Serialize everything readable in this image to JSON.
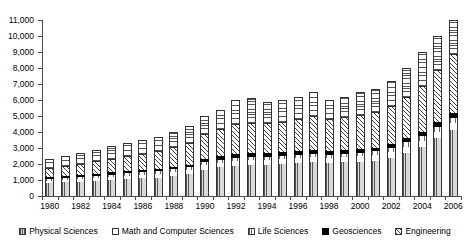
{
  "chart_data": {
    "type": "bar",
    "stacked": true,
    "title": "",
    "xlabel": "",
    "ylabel": "",
    "ylim": [
      0,
      11000
    ],
    "ytick_step": 1000,
    "ytick_labels": [
      "0",
      "1,000",
      "2,000",
      "3,000",
      "4,000",
      "5,000",
      "6,000",
      "7,000",
      "8,000",
      "9,000",
      "10,000",
      "11,000"
    ],
    "grid": false,
    "legend_position": "bottom",
    "categories": [
      "1980",
      "1981",
      "1982",
      "1983",
      "1984",
      "1985",
      "1986",
      "1987",
      "1988",
      "1989",
      "1990",
      "1991",
      "1992",
      "1993",
      "1994",
      "1995",
      "1996",
      "1997",
      "1998",
      "1999",
      "2000",
      "2001",
      "2002",
      "2003",
      "2004",
      "2005",
      "2006"
    ],
    "xtick_labels_shown": [
      "1980",
      "1982",
      "1984",
      "1986",
      "1988",
      "1990",
      "1992",
      "1994",
      "1996",
      "1998",
      "2000",
      "2002",
      "2004",
      "2006"
    ],
    "series": [
      {
        "name": "Physical Sciences",
        "values": [
          800,
          850,
          900,
          950,
          1000,
          1050,
          1100,
          1150,
          1250,
          1350,
          1650,
          1800,
          1900,
          1950,
          1950,
          2000,
          2050,
          2100,
          2050,
          2100,
          2150,
          2200,
          2400,
          2700,
          3050,
          3600,
          4100
        ]
      },
      {
        "name": "Math and Computer Sciences",
        "values": [
          150,
          160,
          170,
          180,
          190,
          200,
          210,
          220,
          240,
          250,
          260,
          270,
          280,
          290,
          290,
          300,
          310,
          320,
          310,
          320,
          330,
          340,
          360,
          380,
          400,
          430,
          460
        ]
      },
      {
        "name": "Life Sciences",
        "values": [
          120,
          125,
          130,
          140,
          150,
          160,
          165,
          170,
          180,
          190,
          200,
          210,
          215,
          220,
          220,
          225,
          230,
          235,
          230,
          235,
          240,
          245,
          255,
          270,
          285,
          300,
          320
        ]
      },
      {
        "name": "Geosciences",
        "values": [
          110,
          120,
          125,
          130,
          140,
          145,
          150,
          160,
          170,
          180,
          200,
          210,
          215,
          220,
          215,
          220,
          225,
          230,
          220,
          225,
          230,
          240,
          250,
          270,
          290,
          310,
          330
        ]
      },
      {
        "name": "Engineering",
        "values": [
          500,
          560,
          620,
          700,
          780,
          860,
          950,
          1050,
          1150,
          1300,
          1500,
          1650,
          1800,
          1850,
          1800,
          1850,
          1950,
          2050,
          1950,
          2000,
          2050,
          2150,
          2300,
          2500,
          2800,
          3200,
          3600
        ]
      },
      {
        "name": "Other",
        "values": [
          620,
          685,
          755,
          800,
          840,
          885,
          925,
          950,
          1010,
          1130,
          1190,
          1260,
          1590,
          1570,
          1425,
          1405,
          1435,
          1565,
          1240,
          1320,
          1500,
          1525,
          1635,
          1880,
          2175,
          2160,
          2190
        ]
      }
    ],
    "totals": [
      2300,
      2500,
      2700,
      2900,
      3100,
      3300,
      3500,
      3700,
      4000,
      4400,
      5000,
      5400,
      6000,
      6100,
      5900,
      6000,
      6200,
      6500,
      6000,
      6200,
      6500,
      6700,
      7200,
      8000,
      9000,
      10000,
      11000
    ]
  },
  "legend": {
    "items": [
      {
        "label": "Physical Sciences",
        "swatch": "p-phys"
      },
      {
        "label": "Math and Computer Sciences",
        "swatch": "p-math"
      },
      {
        "label": "Life Sciences",
        "swatch": "p-life"
      },
      {
        "label": "Geosciences",
        "swatch": "p-geo"
      },
      {
        "label": "Engineering",
        "swatch": "p-eng"
      }
    ]
  }
}
